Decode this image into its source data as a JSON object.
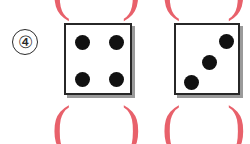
{
  "worksheet": {
    "item_number_label": "④",
    "background_color": "#ffffff",
    "ink_color": "#272727",
    "answer_blank_color": "#e8616b"
  },
  "dice": [
    {
      "name": "left-die",
      "face_value": 4,
      "pip_layout": "four-corners",
      "x": 64,
      "y": 23,
      "width": 68,
      "height": 72,
      "pips": [
        {
          "cx": 16,
          "cy": 17,
          "r": 7.5
        },
        {
          "cx": 50,
          "cy": 17,
          "r": 7.5
        },
        {
          "cx": 16,
          "cy": 54,
          "r": 7.5
        },
        {
          "cx": 50,
          "cy": 54,
          "r": 7.5
        }
      ]
    },
    {
      "name": "right-die",
      "face_value": 3,
      "pip_layout": "diagonal",
      "x": 174,
      "y": 23,
      "width": 66,
      "height": 72,
      "pips": [
        {
          "cx": 50,
          "cy": 16,
          "r": 7.5
        },
        {
          "cx": 33,
          "cy": 37,
          "r": 7.5
        },
        {
          "cx": 15,
          "cy": 57,
          "r": 7.5
        }
      ]
    }
  ],
  "answer_blanks": [
    {
      "name": "answer-blank-top-left",
      "row": "top",
      "clipped": true,
      "open_label": "(",
      "close_label": ")",
      "open_x": 52,
      "close_x": 122
    },
    {
      "name": "answer-blank-top-right",
      "row": "top",
      "clipped": true,
      "open_label": "(",
      "close_label": ")",
      "open_x": 162,
      "close_x": 227
    },
    {
      "name": "answer-blank-bottom-left",
      "row": "bottom",
      "clipped": false,
      "open_label": "(",
      "close_label": ")",
      "open_x": 52,
      "close_x": 122
    },
    {
      "name": "answer-blank-bottom-right",
      "row": "bottom",
      "clipped": false,
      "open_label": "(",
      "close_label": ")",
      "open_x": 162,
      "close_x": 227
    }
  ]
}
